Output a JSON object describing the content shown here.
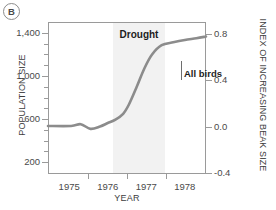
{
  "panel": {
    "label": "B"
  },
  "chart_data": {
    "type": "line",
    "title": "",
    "xlabel": "YEAR",
    "ylabel": "POPULATION SIZE",
    "y2label": "INDEX OF INCREASING BEAK SIZE",
    "grid": false,
    "legend_position": "inline-annotation",
    "xlim": [
      1974.45,
      1978.55
    ],
    "ylim": [
      100,
      1500
    ],
    "y2lim": [
      -0.4,
      0.9
    ],
    "xticks": [
      1975,
      1976,
      1977,
      1978
    ],
    "xtick_labels": [
      "1975",
      "1976",
      "1977",
      "1978"
    ],
    "yticks": [
      200,
      600,
      1000,
      1400
    ],
    "ytick_labels": [
      "200",
      "600",
      "1,000",
      "1,400"
    ],
    "y2ticks": [
      -0.4,
      0.0,
      0.4,
      0.8
    ],
    "y2tick_labels": [
      "-0.4",
      "0.0",
      "0.4",
      "0.8"
    ],
    "series": [
      {
        "name": "All birds",
        "axis": "right",
        "color": "#8c8c8c",
        "x": [
          1974.45,
          1975.05,
          1975.3,
          1975.55,
          1975.8,
          1976.0,
          1976.2,
          1976.4,
          1976.55,
          1976.75,
          1976.95,
          1977.15,
          1977.4,
          1977.7,
          1978.0,
          1978.3,
          1978.55
        ],
        "values": [
          0.005,
          0.005,
          0.02,
          -0.02,
          0.0,
          0.03,
          0.06,
          0.11,
          0.19,
          0.34,
          0.5,
          0.62,
          0.7,
          0.725,
          0.745,
          0.76,
          0.775
        ]
      }
    ],
    "annotations": [
      {
        "name": "drought-band",
        "label": "Drought",
        "x_start": 1976.15,
        "x_end": 1977.5,
        "shade_color": "#f2f2f2"
      },
      {
        "name": "series-callout",
        "label": "All birds"
      }
    ]
  }
}
